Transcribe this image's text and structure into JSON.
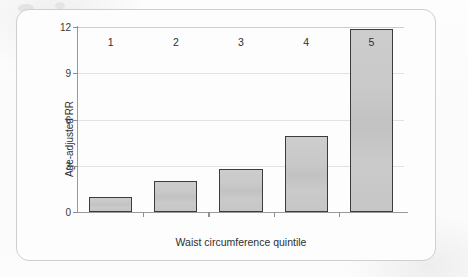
{
  "figure": {
    "frame_color": "#cfcfcf",
    "background_color": "#fdfdfd"
  },
  "chart_data": {
    "type": "bar",
    "title": "",
    "subtitle": "",
    "xlabel": "Waist circumference quintile",
    "ylabel": "Age-adjusted RR",
    "categories": [
      "1",
      "2",
      "3",
      "4",
      "5"
    ],
    "values": [
      1.0,
      2.0,
      2.8,
      4.9,
      11.9
    ],
    "series": [
      {
        "name": "Age-adjusted RR",
        "values": [
          1.0,
          2.0,
          2.8,
          4.9,
          11.9
        ]
      }
    ],
    "ylim": [
      0,
      12
    ],
    "yticks": [
      0,
      3,
      6,
      9,
      12
    ],
    "ytick_labels": [
      "0",
      "3",
      "6",
      "9",
      "12"
    ],
    "xtick_labels": [
      "1",
      "2",
      "3",
      "4",
      "5"
    ],
    "grid": true,
    "grid_axis": "y",
    "legend": false,
    "legend_position": "none",
    "bar_fill_color": "#c8c8c8",
    "bar_edge_color": "#3c3c3c",
    "gridline_color": "#e2e2e2",
    "axis_color": "#9a9a9a"
  }
}
